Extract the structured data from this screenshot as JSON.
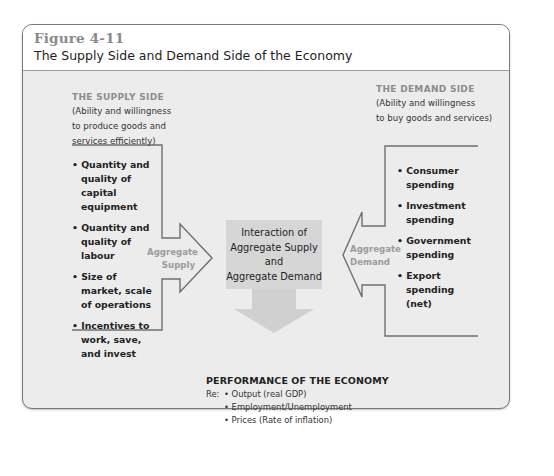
{
  "figure": {
    "number": "Figure 4-11",
    "title": "The Supply Side and Demand Side of the Economy"
  },
  "supply_side": {
    "heading": "THE SUPPLY SIDE",
    "subtitle_lines": [
      "(Ability and willingness",
      "to produce goods and",
      "services efficiently)"
    ],
    "factors": [
      "• Quantity and quality of capital equipment",
      "• Quantity and quality of labour",
      "• Size of market, scale of operations",
      "• Incentives to work, save, and invest"
    ],
    "arrow_label_lines": [
      "Aggregate",
      "Supply"
    ]
  },
  "demand_side": {
    "heading": "THE DEMAND SIDE",
    "subtitle_lines": [
      "(Ability and willingness",
      "to buy goods and services)"
    ],
    "factors": [
      "• Consumer spending",
      "• Investment spending",
      "• Government spending",
      "• Export spending (net)"
    ],
    "arrow_label_lines": [
      "Aggregate",
      "Demand"
    ]
  },
  "interaction": {
    "lines": [
      "Interaction of",
      "Aggregate Supply",
      "and",
      "Aggregate Demand"
    ]
  },
  "performance": {
    "heading": "PERFORMANCE OF THE ECONOMY",
    "prefix": "Re:",
    "items": [
      "• Output (real GDP)",
      "• Employment/Unemployment",
      "• Prices (Rate of inflation)"
    ]
  },
  "colors": {
    "frame_body": "#ececec",
    "header": "#ffffff",
    "bracket_stroke": "#6f6f6f",
    "interaction_box": "#d6d6d6",
    "down_arrow": "#d0d0d0",
    "muted_label": "#9b9b9b"
  }
}
